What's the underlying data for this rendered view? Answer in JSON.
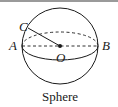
{
  "figure": {
    "caption": "Sphere",
    "labels": {
      "point_a": "A",
      "point_b": "B",
      "point_c": "C",
      "center_o": "O"
    },
    "elements": [
      "outer-circle",
      "equator-ellipse-back-dashed",
      "equator-ellipse-front-solid",
      "diameter-AB-dashed",
      "radius-OC-solid",
      "center-dot-O"
    ],
    "colors": {
      "stroke": "#1a1a1a",
      "top_rule": "#9a9a9a",
      "background": "#ffffff"
    }
  }
}
